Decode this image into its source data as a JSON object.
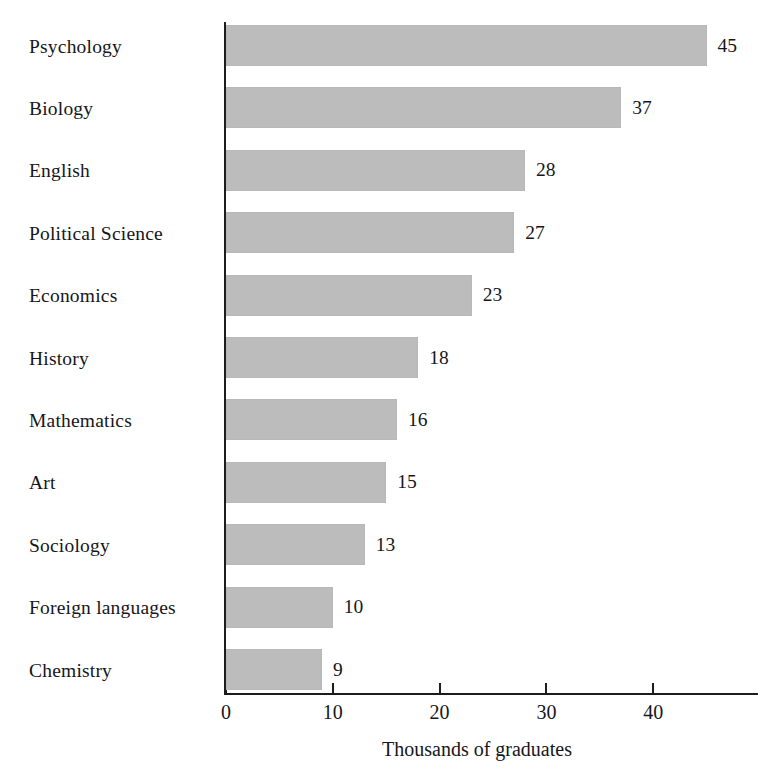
{
  "chart_data": {
    "type": "bar",
    "orientation": "horizontal",
    "title": "",
    "xlabel": "Thousands of graduates",
    "ylabel": "",
    "categories": [
      "Psychology",
      "Biology",
      "English",
      "Political Science",
      "Economics",
      "History",
      "Mathematics",
      "Art",
      "Sociology",
      "Foreign languages",
      "Chemistry"
    ],
    "values": [
      45,
      37,
      28,
      27,
      23,
      18,
      16,
      15,
      13,
      10,
      9
    ],
    "value_labels": [
      "45",
      "37",
      "28",
      "27",
      "23",
      "18",
      "16",
      "15",
      "13",
      "10",
      "9"
    ],
    "xlim": [
      0,
      50
    ],
    "xticks": [
      0,
      10,
      20,
      30,
      40
    ],
    "xtick_labels": [
      "0",
      "10",
      "20",
      "30",
      "40"
    ],
    "grid": false,
    "legend": false,
    "bar_color": "#bcbcbc",
    "axis_color": "#1d1d1f",
    "text_color": "#16161a",
    "background": "#ffffff"
  }
}
